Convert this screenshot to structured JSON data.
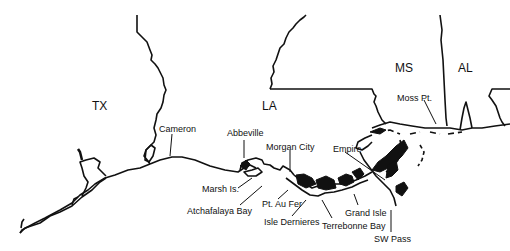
{
  "map": {
    "region": "Northern Gulf of Mexico coast",
    "states": [
      {
        "label": "TX",
        "x": 92,
        "y": 107
      },
      {
        "label": "LA",
        "x": 262,
        "y": 107
      },
      {
        "label": "MS",
        "x": 395,
        "y": 62
      },
      {
        "label": "AL",
        "x": 458,
        "y": 62
      }
    ],
    "places": [
      {
        "label": "Cameron",
        "x": 159,
        "y": 125
      },
      {
        "label": "Abbeville",
        "x": 227,
        "y": 129
      },
      {
        "label": "Morgan City",
        "x": 266,
        "y": 143
      },
      {
        "label": "Empire",
        "x": 333,
        "y": 145
      },
      {
        "label": "Moss Pt.",
        "x": 397,
        "y": 94
      },
      {
        "label": "Marsh Is.",
        "x": 202,
        "y": 183
      },
      {
        "label": "Atchafalaya Bay",
        "x": 187,
        "y": 207
      },
      {
        "label": "Pt. Au Fer",
        "x": 262,
        "y": 199
      },
      {
        "label": "Isle Dernieres",
        "x": 264,
        "y": 219
      },
      {
        "label": "Grand Isle",
        "x": 345,
        "y": 209
      },
      {
        "label": "Terrebonne Bay",
        "x": 322,
        "y": 221
      },
      {
        "label": "SW Pass",
        "x": 374,
        "y": 235
      }
    ]
  }
}
